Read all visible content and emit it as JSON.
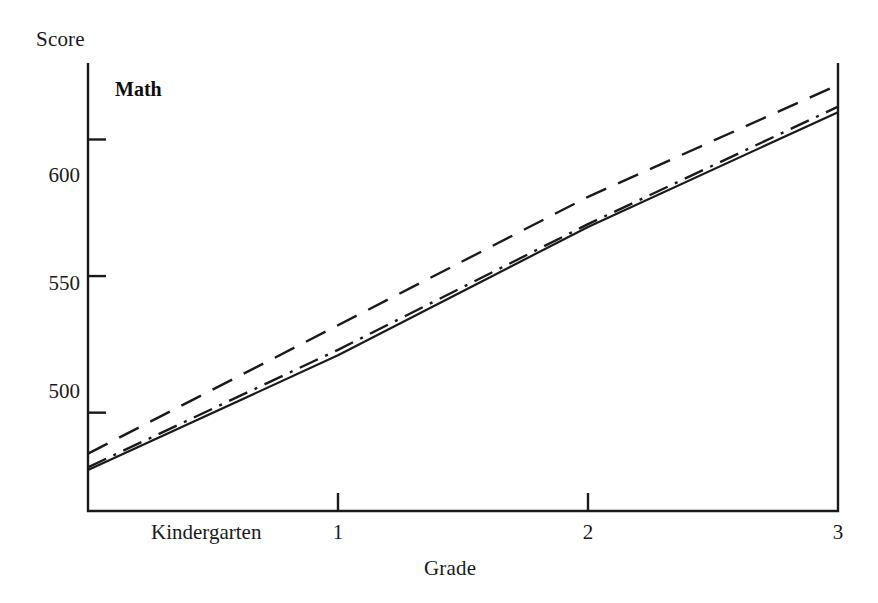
{
  "figure": {
    "panel_label": "Math",
    "y_axis_title": "Score",
    "x_axis_title": "Grade",
    "ink_color": "#1a1a1a"
  },
  "chart_data": {
    "type": "line",
    "title": "Math",
    "xlabel": "Grade",
    "ylabel": "Score",
    "categories": [
      "Kindergarten",
      "1",
      "2",
      "3"
    ],
    "x": [
      0,
      1,
      2,
      3
    ],
    "xtick_labels": [
      "Kindergarten",
      "1",
      "2",
      "3"
    ],
    "ytick_labels": [
      "500",
      "550",
      "600"
    ],
    "yticks": [
      500,
      550,
      600
    ],
    "ylim": [
      464,
      628
    ],
    "xlim": [
      0,
      3
    ],
    "grid": false,
    "legend": "none",
    "series": [
      {
        "name": "solid-line",
        "linestyle": "solid",
        "values": [
          479,
          521,
          568,
          610
        ]
      },
      {
        "name": "dash-dot-line",
        "linestyle": "dashdot",
        "values": [
          480,
          523,
          569,
          612
        ]
      },
      {
        "name": "dashed-line",
        "linestyle": "dashed",
        "values": [
          485,
          532,
          579,
          620
        ]
      }
    ]
  }
}
